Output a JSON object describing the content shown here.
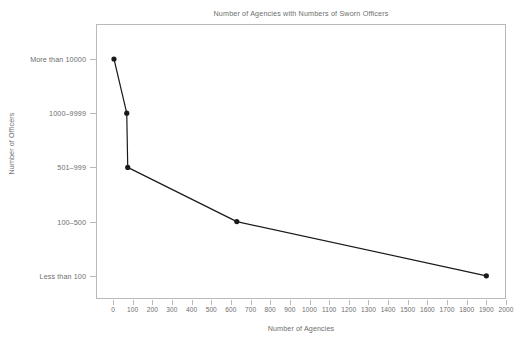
{
  "chart_data": {
    "type": "line",
    "title": "Number of Agencies with Numbers of Sworn Officers",
    "xlabel": "Number of Agencies",
    "ylabel": "Number of Officers",
    "categories": [
      "More than 10000",
      "1000–9999",
      "501–999",
      "100–500",
      "Less than 100"
    ],
    "x": [
      5,
      70,
      75,
      630,
      1900
    ],
    "points": [
      {
        "category": "More than 10000",
        "agencies": 5
      },
      {
        "category": "1000–9999",
        "agencies": 70
      },
      {
        "category": "501–999",
        "agencies": 75
      },
      {
        "category": "100–500",
        "agencies": 630
      },
      {
        "category": "Less than 100",
        "agencies": 1900
      }
    ],
    "xlim": [
      0,
      2000
    ],
    "xticks": [
      0,
      100,
      200,
      300,
      400,
      500,
      600,
      700,
      800,
      900,
      1000,
      1100,
      1200,
      1300,
      1400,
      1500,
      1600,
      1700,
      1800,
      1900,
      2000
    ],
    "xtick_labels": [
      "0",
      "100",
      "200",
      "300",
      "400",
      "500",
      "600",
      "700",
      "800",
      "900",
      "1000",
      "1100",
      "1200",
      "1300",
      "1400",
      "1500",
      "1600",
      "1700",
      "1800",
      "1900",
      "2000"
    ],
    "grid": false,
    "legend": null,
    "series_color": "#1a1a1a",
    "marker": "circle",
    "axis_color": "#b9b9bd",
    "text_color": "#6e6e6e"
  }
}
